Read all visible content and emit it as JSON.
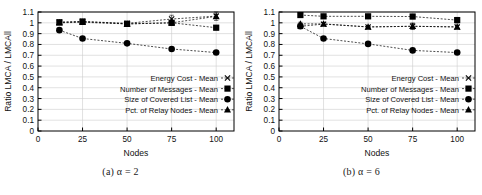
{
  "figure": {
    "panels": [
      {
        "id": "panel-a",
        "caption_prefix": "(a)",
        "caption_symbol": "α",
        "caption_eq": "= 2",
        "caption_full": "(a) α = 2"
      },
      {
        "id": "panel-b",
        "caption_prefix": "(b)",
        "caption_symbol": "α",
        "caption_eq": "= 6",
        "caption_full": "(b) α = 6"
      }
    ]
  },
  "axis": {
    "ylabel": "Ratio LMCA / LMCAll",
    "xlabel": "Nodes",
    "yticks": [
      "0",
      "0.1",
      "0.2",
      "0.3",
      "0.4",
      "0.5",
      "0.6",
      "0.7",
      "0.8",
      "0.9",
      "1",
      "1.1"
    ],
    "xticks": [
      "0",
      "25",
      "50",
      "75",
      "100"
    ]
  },
  "legend": {
    "items": [
      {
        "label": "Energy Cost - Mean",
        "marker": "cross-marker"
      },
      {
        "label": "Number of Messages - Mean",
        "marker": "square-marker"
      },
      {
        "label": "Size of Covered List - Mean",
        "marker": "circle-marker"
      },
      {
        "label": "Pct. of Relay Nodes - Mean",
        "marker": "triangle-marker"
      }
    ]
  },
  "colors": {
    "line": "#000000",
    "grid": "#cccccc",
    "axis": "#000000",
    "background": "#ffffff"
  },
  "chart_data": [
    {
      "type": "line",
      "title": "(a) α = 2",
      "xlabel": "Nodes",
      "ylabel": "Ratio LMCA / LMCAll",
      "xlim": [
        0,
        110
      ],
      "ylim": [
        0,
        1.1
      ],
      "grid": true,
      "legend_position": "lower-right",
      "x": [
        12,
        25,
        50,
        75,
        100
      ],
      "series": [
        {
          "name": "Energy Cost - Mean",
          "marker": "cross",
          "values": [
            1.005,
            1.012,
            0.995,
            1.035,
            1.062
          ],
          "errors": [
            0.02,
            0.02,
            0.02,
            0.035,
            0.04
          ]
        },
        {
          "name": "Number of Messages - Mean",
          "marker": "square",
          "values": [
            1.005,
            1.012,
            0.99,
            1.0,
            0.955
          ],
          "errors": [
            0.015,
            0.015,
            0.012,
            0.02,
            0.02
          ]
        },
        {
          "name": "Size of Covered List - Mean",
          "marker": "circle",
          "values": [
            0.932,
            0.855,
            0.81,
            0.758,
            0.725
          ],
          "errors": [
            0.012,
            0.012,
            0.012,
            0.012,
            0.012
          ]
        },
        {
          "name": "Pct. of Relay Nodes - Mean",
          "marker": "triangle",
          "values": [
            1.0,
            1.005,
            0.99,
            1.0,
            1.06
          ],
          "errors": [
            0.015,
            0.015,
            0.012,
            0.02,
            0.02
          ]
        }
      ]
    },
    {
      "type": "line",
      "title": "(b) α = 6",
      "xlabel": "Nodes",
      "ylabel": "Ratio LMCA / LMCAll",
      "xlim": [
        0,
        110
      ],
      "ylim": [
        0,
        1.1
      ],
      "grid": true,
      "legend_position": "lower-right",
      "x": [
        12,
        25,
        50,
        75,
        100
      ],
      "series": [
        {
          "name": "Energy Cost - Mean",
          "marker": "cross",
          "values": [
            0.968,
            0.988,
            0.962,
            0.968,
            0.962
          ],
          "errors": [
            0.012,
            0.015,
            0.012,
            0.03,
            0.015
          ]
        },
        {
          "name": "Number of Messages - Mean",
          "marker": "square",
          "values": [
            1.072,
            1.06,
            1.06,
            1.058,
            1.025
          ],
          "errors": [
            0.015,
            0.015,
            0.015,
            0.02,
            0.025
          ]
        },
        {
          "name": "Size of Covered List - Mean",
          "marker": "circle",
          "values": [
            0.968,
            0.855,
            0.805,
            0.745,
            0.725
          ],
          "errors": [
            0.012,
            0.012,
            0.012,
            0.012,
            0.012
          ]
        },
        {
          "name": "Pct. of Relay Nodes - Mean",
          "marker": "triangle",
          "values": [
            0.99,
            0.99,
            0.962,
            0.968,
            0.962
          ],
          "errors": [
            0.015,
            0.015,
            0.012,
            0.025,
            0.015
          ]
        }
      ]
    }
  ]
}
